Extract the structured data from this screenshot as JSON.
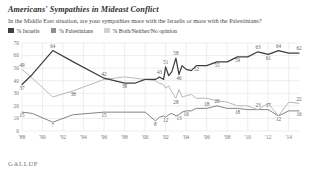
{
  "header": {
    "title": "Americans' Sympathies in Mideast Conflict",
    "subtitle": "In the Middle East situation, are your sympathies more with the Israelis or more with the Palestinians?"
  },
  "legend": {
    "position": "top-left",
    "items": [
      {
        "label": "% Israelis",
        "color": "#3f3f3f",
        "swatch_name": "legend-swatch-israelis"
      },
      {
        "label": "% Palestinians",
        "color": "#8f8f8f",
        "swatch_name": "legend-swatch-palestinians"
      },
      {
        "label": "% Both/Neither/No opinion",
        "color": "#d2d2d2",
        "swatch_name": "legend-swatch-both"
      }
    ]
  },
  "source": {
    "logo": "GALLUP"
  },
  "colors": {
    "israelis": "#3f3f3f",
    "palestinians": "#b5b5b5",
    "both": "#9a9a9a",
    "grid": "#dcdcdc",
    "axis_text": "#777777",
    "label_text": "#5d5d5d",
    "background": "#ffffff"
  },
  "chart_data": {
    "type": "line",
    "title": "Americans' Sympathies in Mideast Conflict",
    "subtitle": "In the Middle East situation, are your sympathies more with the Israelis or more with the Palestinians?",
    "xlabel": "",
    "ylabel": "",
    "ylim": [
      0,
      70
    ],
    "yticks": [
      0,
      10,
      20,
      30,
      40,
      50,
      60,
      70
    ],
    "ytick_labels": [
      "0",
      "10",
      "20",
      "30",
      "40",
      "50",
      "60",
      "70"
    ],
    "xlim": [
      1988,
      2015
    ],
    "xticks": [
      1988,
      1990,
      1992,
      1994,
      1996,
      1998,
      2000,
      2002,
      2004,
      2006,
      2008,
      2010,
      2012,
      2014
    ],
    "xtick_labels": [
      "'88",
      "'90",
      "'92",
      "'94",
      "'96",
      "'98",
      "'00",
      "'02",
      "'04",
      "'06",
      "'08",
      "'10",
      "'12",
      "'14"
    ],
    "grid": true,
    "legend_position": "top-left",
    "series": [
      {
        "name": "% Israelis",
        "color": "#3f3f3f",
        "x": [
          1988,
          1989,
          1991,
          1993,
          1996,
          1998,
          1999,
          2000,
          2001,
          2001.4,
          2001.8,
          2002,
          2002.3,
          2002.6,
          2003,
          2003.3,
          2003.6,
          2004,
          2004.5,
          2005,
          2006,
          2007,
          2008,
          2009,
          2010,
          2011,
          2012,
          2013,
          2014,
          2015
        ],
        "y": [
          37,
          45,
          64,
          55,
          42,
          38,
          38,
          41,
          41,
          43,
          41,
          51,
          44,
          47,
          58,
          45,
          52,
          49,
          48,
          52,
          52,
          55,
          55,
          59,
          59,
          63,
          61,
          64,
          62,
          62
        ],
        "labels": [
          {
            "x": 1988,
            "y": 37,
            "text": "37",
            "pos": "below"
          },
          {
            "x": 1991,
            "y": 64,
            "text": "64",
            "pos": "above"
          },
          {
            "x": 1996,
            "y": 42,
            "text": "42",
            "pos": "above"
          },
          {
            "x": 1998,
            "y": 38,
            "text": "38",
            "pos": "below"
          },
          {
            "x": 2001.4,
            "y": 43,
            "text": "43",
            "pos": "above"
          },
          {
            "x": 2002,
            "y": 51,
            "text": "51",
            "pos": "above"
          },
          {
            "x": 2003,
            "y": 58,
            "text": "58",
            "pos": "above"
          },
          {
            "x": 2003.3,
            "y": 45,
            "text": "46",
            "pos": "below"
          },
          {
            "x": 2005,
            "y": 52,
            "text": "52",
            "pos": "below"
          },
          {
            "x": 2007,
            "y": 55,
            "text": "55",
            "pos": "below"
          },
          {
            "x": 2009,
            "y": 59,
            "text": "59",
            "pos": "below"
          },
          {
            "x": 2011,
            "y": 63,
            "text": "63",
            "pos": "above"
          },
          {
            "x": 2012,
            "y": 61,
            "text": "61",
            "pos": "below"
          },
          {
            "x": 2013,
            "y": 64,
            "text": "64",
            "pos": "above"
          },
          {
            "x": 2015,
            "y": 62,
            "text": "62",
            "pos": "above"
          }
        ]
      },
      {
        "name": "% Palestinians",
        "color": "#b5b5b5",
        "x": [
          1988,
          1989,
          1991,
          1993,
          1996,
          1998,
          1999,
          2000,
          2001,
          2001.4,
          2001.8,
          2002,
          2002.3,
          2002.6,
          2003,
          2003.3,
          2003.6,
          2004,
          2004.5,
          2005,
          2006,
          2007,
          2008,
          2009,
          2010,
          2011,
          2012,
          2013,
          2014,
          2015
        ],
        "y": [
          49,
          42,
          27,
          32,
          41,
          43,
          42,
          41,
          40,
          38,
          37,
          34,
          36,
          31,
          26,
          33,
          27,
          28,
          29,
          26,
          26,
          24,
          23,
          20,
          20,
          17,
          22,
          12,
          23,
          22
        ],
        "labels": [
          {
            "x": 1988,
            "y": 49,
            "text": "49",
            "pos": "above"
          },
          {
            "x": 1993,
            "y": 32,
            "text": "38",
            "pos": "below"
          },
          {
            "x": 2003,
            "y": 26,
            "text": "28",
            "pos": "below"
          },
          {
            "x": 2011,
            "y": 17,
            "text": "23",
            "pos": "above"
          },
          {
            "x": 2015,
            "y": 22,
            "text": "22",
            "pos": "above"
          }
        ]
      },
      {
        "name": "% Both/Neither/No opinion",
        "color": "#7d7d7d",
        "x": [
          1988,
          1989,
          1991,
          1993,
          1996,
          1998,
          1999,
          2000,
          2001,
          2001.4,
          2001.8,
          2002,
          2002.3,
          2002.6,
          2003,
          2003.3,
          2003.6,
          2004,
          2004.5,
          2005,
          2006,
          2007,
          2008,
          2009,
          2010,
          2011,
          2012,
          2013,
          2014,
          2015
        ],
        "y": [
          15,
          14,
          7,
          13,
          15,
          15,
          15,
          15,
          8,
          11,
          12,
          11,
          13,
          14,
          12,
          13,
          15,
          16,
          16,
          18,
          18,
          20,
          18,
          18,
          17,
          17,
          17,
          12,
          16,
          16
        ],
        "labels": [
          {
            "x": 1988,
            "y": 15,
            "text": "15",
            "pos": "below"
          },
          {
            "x": 1991,
            "y": 7,
            "text": "7",
            "pos": "below"
          },
          {
            "x": 1996,
            "y": 15,
            "text": "15",
            "pos": "below"
          },
          {
            "x": 2001,
            "y": 8,
            "text": "8",
            "pos": "below"
          },
          {
            "x": 2002,
            "y": 11,
            "text": "12",
            "pos": "below"
          },
          {
            "x": 2003.3,
            "y": 13,
            "text": "13",
            "pos": "below"
          },
          {
            "x": 2004,
            "y": 16,
            "text": "16",
            "pos": "below"
          },
          {
            "x": 2006,
            "y": 18,
            "text": "18",
            "pos": "above"
          },
          {
            "x": 2007,
            "y": 20,
            "text": "20",
            "pos": "above"
          },
          {
            "x": 2009,
            "y": 18,
            "text": "18",
            "pos": "below"
          },
          {
            "x": 2012,
            "y": 17,
            "text": "17",
            "pos": "above"
          },
          {
            "x": 2013,
            "y": 12,
            "text": "12",
            "pos": "below"
          },
          {
            "x": 2015,
            "y": 16,
            "text": "16",
            "pos": "below"
          }
        ]
      }
    ]
  }
}
